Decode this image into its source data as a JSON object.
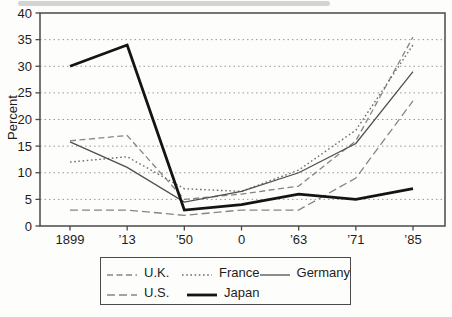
{
  "chart_data": {
    "type": "line",
    "title": "",
    "xlabel": "",
    "ylabel": "Percent",
    "ylim": [
      0,
      40
    ],
    "y_tick_step": 5,
    "y_ticks": [
      0,
      5,
      10,
      15,
      20,
      25,
      30,
      35,
      40
    ],
    "categories": [
      "1899",
      "’13",
      "’50",
      "0",
      "’63",
      "’71",
      "’85"
    ],
    "grid": "horizontal-dotted",
    "legend_position": "bottom-center",
    "frame_color": "#4a4a4a",
    "grid_color": "#999999",
    "series": [
      {
        "key": "uk",
        "name": "U.K.",
        "values": [
          16,
          17,
          5,
          6,
          7.5,
          16,
          35.5
        ],
        "line_style": "dashed",
        "color": "#858585",
        "width": 1.3,
        "dash": "6 3.5"
      },
      {
        "key": "france",
        "name": "France",
        "values": [
          12,
          13,
          7,
          6.5,
          10.5,
          18,
          34
        ],
        "line_style": "dotted",
        "color": "#6e6e6e",
        "width": 1.4,
        "dash": "1.6 2.6"
      },
      {
        "key": "germany",
        "name": "Germany",
        "values": [
          15.8,
          11,
          4.5,
          6.5,
          10,
          15.5,
          29
        ],
        "line_style": "solid",
        "color": "#4f4f4f",
        "width": 1.3,
        "dash": ""
      },
      {
        "key": "us",
        "name": "U.S.",
        "values": [
          3,
          3,
          2,
          3,
          3,
          9,
          23.5
        ],
        "line_style": "dashed",
        "color": "#858585",
        "width": 1.3,
        "dash": "8 4"
      },
      {
        "key": "japan",
        "name": "Japan",
        "values": [
          30,
          34,
          3,
          4,
          6,
          5,
          7
        ],
        "line_style": "solid-thick",
        "color": "#141414",
        "width": 2.8,
        "dash": ""
      }
    ],
    "legend_rows": [
      [
        "U.K.",
        "France",
        "Germany"
      ],
      [
        "U.S.",
        "Japan"
      ]
    ]
  }
}
